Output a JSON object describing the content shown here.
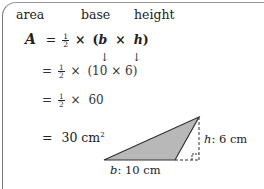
{
  "labels": {
    "area": "area",
    "base": "base",
    "height": "height"
  },
  "formula": {
    "lhs": "A",
    "eq": "=",
    "half_num": "1",
    "half_den": "2",
    "times": "×",
    "open": "(",
    "b": "b",
    "h": "h",
    "close": ")"
  },
  "steps": [
    {
      "eq": "=",
      "half_num": "1",
      "half_den": "2",
      "times": "×",
      "expr": "(10 × 6)"
    },
    {
      "eq": "=",
      "half_num": "1",
      "half_den": "2",
      "times": "×",
      "expr": "60"
    },
    {
      "eq": "=",
      "value": "30 cm",
      "exponent": "2"
    }
  ],
  "arrows": {
    "down": "↓"
  },
  "diagram": {
    "base_label_var": "b",
    "base_label_value": ": 10 cm",
    "height_label_var": "h",
    "height_label_value": ": 6 cm",
    "fill_color": "#b8b8b8",
    "stroke_color": "#333333"
  }
}
